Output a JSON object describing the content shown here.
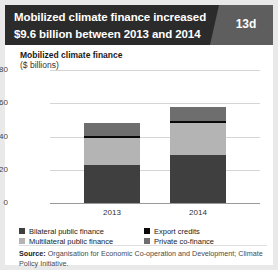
{
  "header": {
    "title_line1": "Mobilized climate finance increased",
    "title_line2": "$9.6 billion between 2013 and 2014",
    "badge": "13d",
    "bg_color": "#2b2b2b",
    "badge_color": "#5e5e5e"
  },
  "chart_data": {
    "type": "bar",
    "title": "Mobilized climate finance",
    "subtitle": "($ billions)",
    "xlabel": "",
    "ylabel": "($ billions)",
    "ylim": [
      0,
      80
    ],
    "yticks": [
      0,
      20,
      40,
      60,
      80
    ],
    "grid": true,
    "stacked": true,
    "legend_position": "bottom",
    "categories": [
      "2013",
      "2014"
    ],
    "series": [
      {
        "name": "Bilateral public finance",
        "values": [
          23.0,
          29.0
        ],
        "color": "#3f3f3f"
      },
      {
        "name": "Multilateral public finance",
        "values": [
          16.0,
          19.0
        ],
        "color": "#b4b4b4"
      },
      {
        "name": "Export credits",
        "values": [
          1.5,
          1.5
        ],
        "color": "#0a0a0a"
      },
      {
        "name": "Private co-finance",
        "values": [
          7.5,
          8.5
        ],
        "color": "#6e6e6e"
      }
    ],
    "totals": [
      48.0,
      58.0
    ],
    "annotations": []
  },
  "source": {
    "label": "Source:",
    "text": " Organisation for Economic Co-operation and Development; Climate Policy Initiative."
  }
}
